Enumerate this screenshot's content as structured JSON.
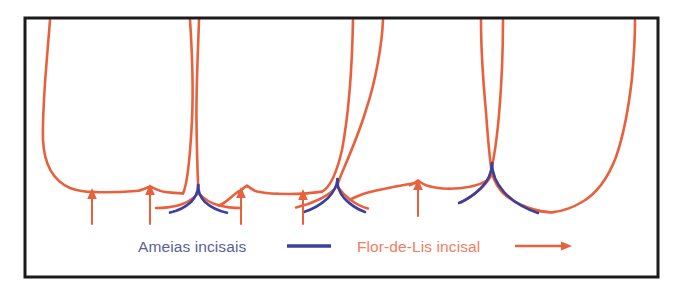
{
  "figure": {
    "frame": {
      "x": 25,
      "y": 18,
      "width": 633,
      "height": 259,
      "stroke_color": "#1b1b1b",
      "stroke_width": 3,
      "fill": "#ffffff"
    },
    "colors": {
      "orange": "#e8603c",
      "orange_light": "#ee7a55",
      "blue": "#3b3f9e",
      "blue_text": "#5a5f9c",
      "orange_text": "#ef7e63",
      "frame": "#1b1b1b",
      "background": "#ffffff"
    }
  },
  "legend": {
    "items": [
      {
        "label": "Ameias incisais",
        "marker": "line",
        "color": "#3b3f9e",
        "text_color": "#5a5f9c"
      },
      {
        "label": "Flor-de-Lis incisal",
        "marker": "arrow",
        "color": "#e8603c",
        "text_color": "#ef7e63"
      }
    ]
  },
  "annotations": {
    "arrow_count": 5,
    "arrow_label": "seta indicadora da Flor-de-Lis incisal",
    "arrows": [
      {
        "x": 92,
        "tip_y": 190,
        "tail_y": 224
      },
      {
        "x": 150,
        "tip_y": 185,
        "tail_y": 224
      },
      {
        "x": 241,
        "tip_y": 190,
        "tail_y": 224
      },
      {
        "x": 303,
        "tip_y": 190,
        "tail_y": 224
      },
      {
        "x": 418,
        "tip_y": 181,
        "tail_y": 216
      }
    ]
  },
  "teeth": {
    "count": 6,
    "names": [
      "incisivo-central-esquerdo",
      "incisivo-central-direito",
      "incisivo-lateral-esquerdo",
      "incisivo-lateral-direito",
      "canino-esquerdo",
      "canino-direito"
    ],
    "embrasure_count": 3,
    "embrasure_label": "ameia incisal"
  },
  "chart_data": {
    "type": "diagram",
    "series": [
      {
        "name": "Ameias incisais",
        "color": "#3b3f9e",
        "count": 3
      },
      {
        "name": "Flor-de-Lis incisal",
        "color": "#e8603c",
        "count": 5
      }
    ]
  }
}
